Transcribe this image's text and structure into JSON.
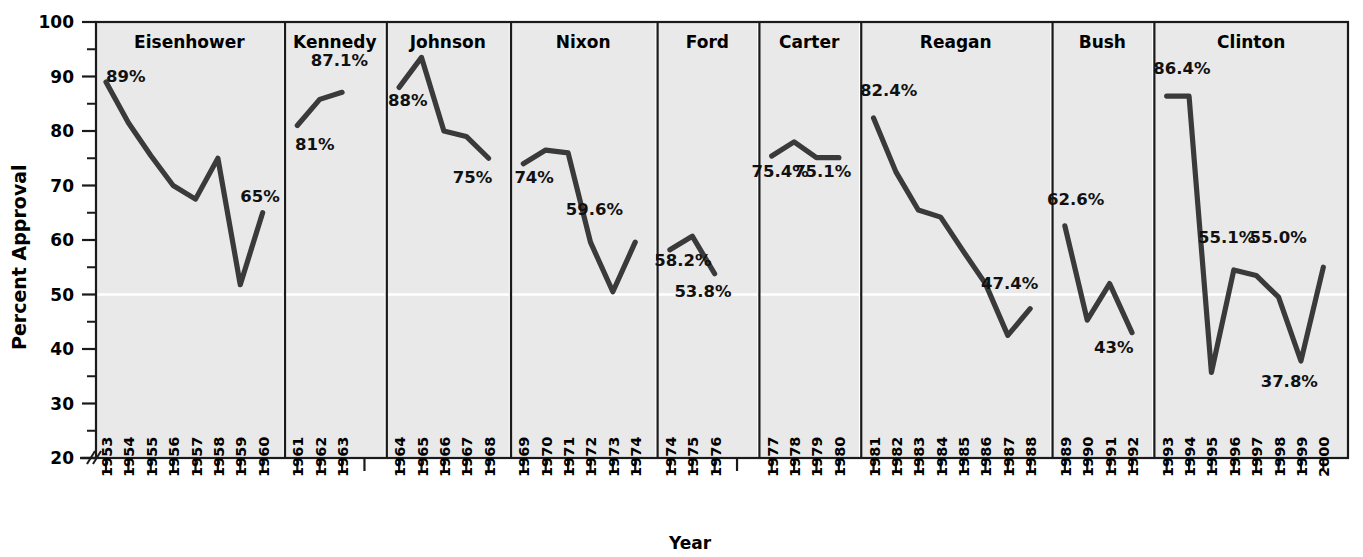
{
  "chart_data": {
    "type": "line",
    "title": "",
    "xlabel": "Year",
    "ylabel": "Percent Approval",
    "ylim": [
      20,
      100
    ],
    "y_ticks": [
      20,
      30,
      40,
      50,
      60,
      70,
      80,
      90,
      100
    ],
    "y_minor_step": 5,
    "axis_break": true,
    "grid": false,
    "reference_line": 50,
    "legend": "none",
    "panels": [
      {
        "name": "Eisenhower",
        "years": [
          1953,
          1954,
          1955,
          1956,
          1957,
          1958,
          1959,
          1960
        ],
        "values": [
          89,
          81.5,
          75.5,
          70.0,
          67.5,
          75.0,
          51.8,
          65
        ],
        "annotations": [
          {
            "text": "89%",
            "year": 1953,
            "value": 89,
            "pos": "above"
          },
          {
            "text": "65%",
            "year": 1959,
            "value": 67,
            "pos": "right"
          }
        ]
      },
      {
        "name": "Kennedy",
        "years": [
          1961,
          1962,
          1963
        ],
        "values": [
          81,
          85.8,
          87.1
        ],
        "annotations": [
          {
            "text": "87.1%",
            "year": 1961.6,
            "value": 92,
            "pos": "above"
          },
          {
            "text": "81%",
            "year": 1960.9,
            "value": 76.5,
            "pos": "below"
          }
        ]
      },
      {
        "name": "Johnson",
        "years": [
          1964,
          1965,
          1966,
          1967,
          1968
        ],
        "values": [
          88,
          93.5,
          80.0,
          79.0,
          75
        ],
        "annotations": [
          {
            "text": "88%",
            "year": 1963.5,
            "value": 84.5,
            "pos": "left"
          },
          {
            "text": "75%",
            "year": 1966.4,
            "value": 70.5,
            "pos": "below"
          }
        ]
      },
      {
        "name": "Nixon",
        "years": [
          1969,
          1970,
          1971,
          1972,
          1973,
          1974
        ],
        "values": [
          74,
          76.5,
          76.0,
          59.6,
          50.5,
          59.6
        ],
        "annotations": [
          {
            "text": "74%",
            "year": 1968.6,
            "value": 70.5,
            "pos": "below"
          },
          {
            "text": "59.6%",
            "year": 1970.9,
            "value": 64.5,
            "pos": "above"
          }
        ]
      },
      {
        "name": "Ford",
        "years": [
          1974,
          1975,
          1976
        ],
        "values": [
          58.2,
          60.7,
          53.8
        ],
        "annotations": [
          {
            "text": "58.2%",
            "year": 1973.3,
            "value": 55.2,
            "pos": "left"
          },
          {
            "text": "53.8%",
            "year": 1974.2,
            "value": 49.5,
            "pos": "below"
          }
        ]
      },
      {
        "name": "Carter",
        "years": [
          1977,
          1978,
          1979,
          1980
        ],
        "values": [
          75.4,
          78.0,
          75.1,
          75.1
        ],
        "annotations": [
          {
            "text": "75.4%",
            "year": 1976.1,
            "value": 71.5,
            "pos": "left"
          },
          {
            "text": "75.1%",
            "year": 1978.0,
            "value": 71.5,
            "pos": "right"
          }
        ]
      },
      {
        "name": "Reagan",
        "years": [
          1981,
          1982,
          1983,
          1984,
          1985,
          1986,
          1987,
          1988
        ],
        "values": [
          82.4,
          72.5,
          65.5,
          64.2,
          58.0,
          52.0,
          42.5,
          47.4
        ],
        "annotations": [
          {
            "text": "82.4%",
            "year": 1980.4,
            "value": 86.5,
            "pos": "above"
          },
          {
            "text": "47.4%",
            "year": 1985.8,
            "value": 51.0,
            "pos": "above"
          }
        ]
      },
      {
        "name": "Bush",
        "years": [
          1989,
          1990,
          1991,
          1992
        ],
        "values": [
          62.6,
          45.3,
          52.0,
          43.0
        ],
        "annotations": [
          {
            "text": "62.6%",
            "year": 1988.2,
            "value": 66.5,
            "pos": "above"
          },
          {
            "text": "43%",
            "year": 1990.3,
            "value": 39.2,
            "pos": "below"
          }
        ]
      },
      {
        "name": "Clinton",
        "years": [
          1993,
          1994,
          1995,
          1996,
          1997,
          1998,
          1999,
          2000
        ],
        "values": [
          86.4,
          86.4,
          35.7,
          54.5,
          53.5,
          49.5,
          37.8,
          55.0
        ],
        "annotations": [
          {
            "text": "86.4%",
            "year": 1992.4,
            "value": 90.5,
            "pos": "above"
          },
          {
            "text": "55.1%",
            "year": 1994.4,
            "value": 59.5,
            "pos": "above"
          },
          {
            "text": "55.0%",
            "year": 1996.7,
            "value": 59.5,
            "pos": "above"
          },
          {
            "text": "37.8%",
            "year": 1997.2,
            "value": 33.0,
            "pos": "below"
          }
        ]
      }
    ]
  },
  "axis": {
    "y_title": "Percent Approval",
    "x_title": "Year",
    "y_tick_labels": [
      "20",
      "30",
      "40",
      "50",
      "60",
      "70",
      "80",
      "90",
      "100"
    ]
  },
  "colors": {
    "line": "#3a3a3a",
    "panel_background": "#e9e9e9",
    "border": "#1a1a1a",
    "reference_line": "#ffffff",
    "text": "#000000"
  }
}
